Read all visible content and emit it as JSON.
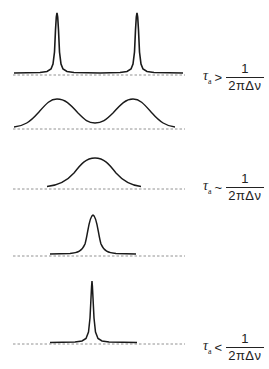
{
  "figure": {
    "panels": [
      {
        "id": "panel-1",
        "shape": "two sharp Lorentzian peaks",
        "baseline_y": 73,
        "peaks": [
          {
            "x": 57,
            "top_y": 13
          },
          {
            "x": 137,
            "top_y": 13
          }
        ],
        "label_index": 0
      },
      {
        "id": "panel-2",
        "shape": "two broadened peaks",
        "baseline_y": 128,
        "peaks": [
          {
            "x": 57,
            "top_y": 99
          },
          {
            "x": 133,
            "top_y": 99
          }
        ],
        "label_index": null
      },
      {
        "id": "panel-3",
        "shape": "single broad coalesced peak",
        "baseline_y": 188,
        "peaks": [
          {
            "x": 95,
            "top_y": 158
          }
        ],
        "label_index": 1
      },
      {
        "id": "panel-4",
        "shape": "single narrowing peak",
        "baseline_y": 255,
        "peaks": [
          {
            "x": 93,
            "top_y": 215
          }
        ],
        "label_index": null
      },
      {
        "id": "panel-5",
        "shape": "single sharp peak",
        "baseline_y": 343,
        "peaks": [
          {
            "x": 92,
            "top_y": 281
          }
        ],
        "label_index": 2
      }
    ]
  },
  "labels": [
    {
      "tau": "τ",
      "sub": "a",
      "relation": ">",
      "numerator": "1",
      "denominator": "2πΔν"
    },
    {
      "tau": "τ",
      "sub": "a",
      "relation": "~",
      "numerator": "1",
      "denominator": "2πΔν"
    },
    {
      "tau": "τ",
      "sub": "a",
      "relation": "<",
      "numerator": "1",
      "denominator": "2πΔν"
    }
  ],
  "colors": {
    "curve": "#1a1a1a",
    "baseline": "#777777",
    "background": "#ffffff"
  }
}
